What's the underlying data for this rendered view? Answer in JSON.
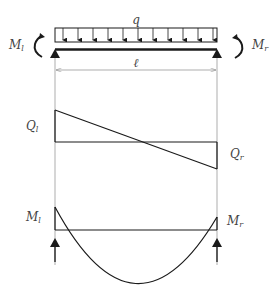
{
  "diagram": {
    "load": {
      "symbol": "q",
      "arrow_count": 12
    },
    "span": {
      "symbol": "ℓ"
    },
    "left_moment": {
      "main": "M",
      "sub": "l"
    },
    "right_moment": {
      "main": "M",
      "sub": "r"
    },
    "shear_left": {
      "main": "Q",
      "sub": "l"
    },
    "shear_right": {
      "main": "Q",
      "sub": "r"
    },
    "moment_left": {
      "main": "M",
      "sub": "l"
    },
    "moment_right": {
      "main": "M",
      "sub": "r"
    },
    "colors": {
      "line": "#1a1a1a",
      "thin": "#8a8a8a",
      "text": "#444444"
    }
  }
}
